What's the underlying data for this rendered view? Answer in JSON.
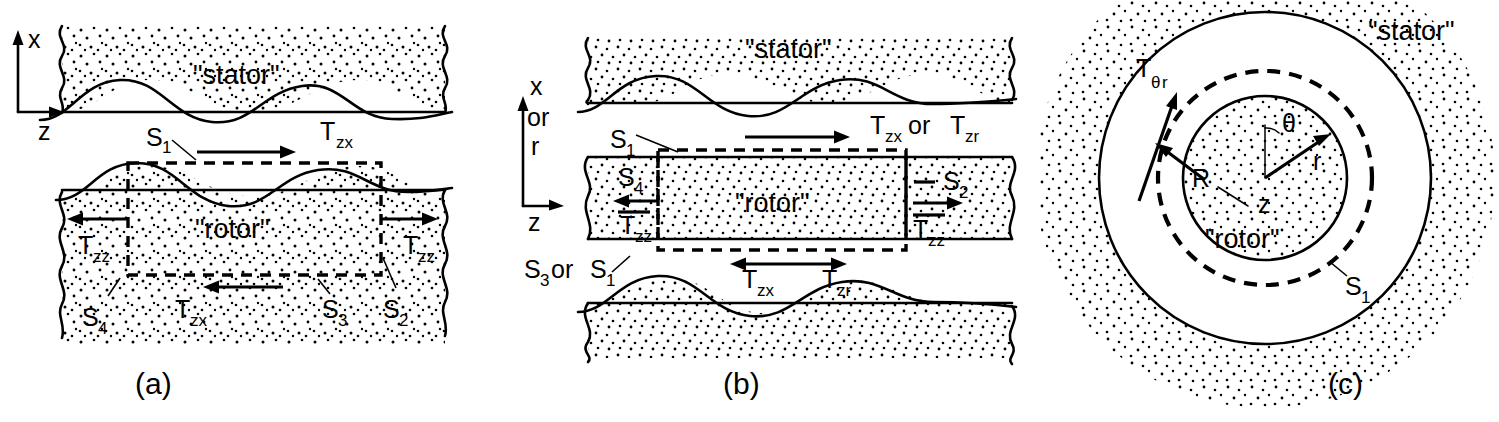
{
  "figure": {
    "domain": "diagram",
    "background_color": "#ffffff",
    "ink_color": "#000000"
  },
  "panels": [
    {
      "id": "a",
      "caption": "(a)",
      "axes": {
        "vertical": "x",
        "horizontal": "z"
      },
      "regions": {
        "stator": "\"stator\"",
        "rotor": "\"rotor\""
      },
      "surfaces": {
        "s1": "S",
        "s1_sub": "1",
        "s2": "S",
        "s2_sub": "2",
        "s3": "S",
        "s3_sub": "3",
        "s4": "S",
        "s4_sub": "4"
      },
      "stresses": {
        "top": "T",
        "top_sub": "zx",
        "left": "T",
        "left_sub": "zz",
        "right": "T",
        "right_sub": "zz",
        "bottom": "T",
        "bottom_sub": "zx"
      }
    },
    {
      "id": "b",
      "caption": "(b)",
      "axes": {
        "vertical_line1": "x",
        "vertical_line2": "or",
        "vertical_line3": "r",
        "horizontal": "z"
      },
      "regions": {
        "stator": "\"stator\"",
        "rotor": "\"rotor\""
      },
      "surfaces": {
        "s1": "S",
        "s1_sub": "1",
        "s2": "S",
        "s2_sub": "2",
        "s4": "S",
        "s4_sub": "4",
        "s3_or_s1_a": "S",
        "s3_or_s1_a_sub": "3",
        "s3_or_s1_or": "or",
        "s3_or_s1_b": "S",
        "s3_or_s1_b_sub": "1"
      },
      "stresses": {
        "top_a": "T",
        "top_a_sub": "zx",
        "top_or": "or",
        "top_b": "T",
        "top_b_sub": "zr",
        "left": "T",
        "left_sub": "zz",
        "right": "T",
        "right_sub": "zz",
        "bottom_a": "T",
        "bottom_a_sub": "zx",
        "bottom_b": "T",
        "bottom_b_sub": "zr"
      }
    },
    {
      "id": "c",
      "caption": "(c)",
      "regions": {
        "stator": "\"stator\"",
        "rotor": "\"rotor\""
      },
      "coords": {
        "radius": "R",
        "theta": "θ",
        "r": "r",
        "z": "z"
      },
      "surfaces": {
        "s1": "S",
        "s1_sub": "1"
      },
      "stresses": {
        "shear": "T",
        "shear_sub_theta": "θ",
        "shear_sub_r": "r"
      }
    }
  ]
}
